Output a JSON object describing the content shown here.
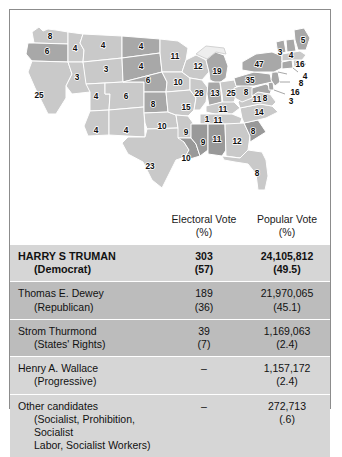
{
  "figure": {
    "kind": "electoral-map-with-results-table"
  },
  "map": {
    "title": "",
    "legend": {
      "winner_shade": "#c9c9c9",
      "runnerup_shade": "#a8a8a8",
      "third_shade": "#999999",
      "border": "#ffffff",
      "outline": "#6b6b6b"
    },
    "states": [
      {
        "code": "WA",
        "name": "Washington",
        "electoral_votes": "8",
        "shade": "light"
      },
      {
        "code": "OR",
        "name": "Oregon",
        "electoral_votes": "6",
        "shade": "dark"
      },
      {
        "code": "CA",
        "name": "California",
        "electoral_votes": "25",
        "shade": "light"
      },
      {
        "code": "ID",
        "name": "Idaho",
        "electoral_votes": "4",
        "shade": "light"
      },
      {
        "code": "NV",
        "name": "Nevada",
        "electoral_votes": "3",
        "shade": "light"
      },
      {
        "code": "MT",
        "name": "Montana",
        "electoral_votes": "4",
        "shade": "light"
      },
      {
        "code": "WY",
        "name": "Wyoming",
        "electoral_votes": "3",
        "shade": "light"
      },
      {
        "code": "UT",
        "name": "Utah",
        "electoral_votes": "4",
        "shade": "light"
      },
      {
        "code": "AZ",
        "name": "Arizona",
        "electoral_votes": "4",
        "shade": "light"
      },
      {
        "code": "CO",
        "name": "Colorado",
        "electoral_votes": "6",
        "shade": "light"
      },
      {
        "code": "NM",
        "name": "New Mexico",
        "electoral_votes": "4",
        "shade": "light"
      },
      {
        "code": "ND",
        "name": "North Dakota",
        "electoral_votes": "4",
        "shade": "dark"
      },
      {
        "code": "SD",
        "name": "South Dakota",
        "electoral_votes": "4",
        "shade": "dark"
      },
      {
        "code": "NE",
        "name": "Nebraska",
        "electoral_votes": "6",
        "shade": "dark"
      },
      {
        "code": "KS",
        "name": "Kansas",
        "electoral_votes": "8",
        "shade": "dark"
      },
      {
        "code": "OK",
        "name": "Oklahoma",
        "electoral_votes": "10",
        "shade": "light"
      },
      {
        "code": "TX",
        "name": "Texas",
        "electoral_votes": "23",
        "shade": "light"
      },
      {
        "code": "MN",
        "name": "Minnesota",
        "electoral_votes": "11",
        "shade": "light"
      },
      {
        "code": "IA",
        "name": "Iowa",
        "electoral_votes": "10",
        "shade": "light"
      },
      {
        "code": "MO",
        "name": "Missouri",
        "electoral_votes": "15",
        "shade": "light"
      },
      {
        "code": "AR",
        "name": "Arkansas",
        "electoral_votes": "9",
        "shade": "light"
      },
      {
        "code": "LA",
        "name": "Louisiana",
        "electoral_votes": "10",
        "shade": "third"
      },
      {
        "code": "WI",
        "name": "Wisconsin",
        "electoral_votes": "12",
        "shade": "light"
      },
      {
        "code": "IL",
        "name": "Illinois",
        "electoral_votes": "28",
        "shade": "light"
      },
      {
        "code": "MI",
        "name": "Michigan",
        "electoral_votes": "19",
        "shade": "dark"
      },
      {
        "code": "IN",
        "name": "Indiana",
        "electoral_votes": "13",
        "shade": "dark"
      },
      {
        "code": "OH",
        "name": "Ohio",
        "electoral_votes": "25",
        "shade": "light"
      },
      {
        "code": "KY",
        "name": "Kentucky",
        "electoral_votes": "11",
        "shade": "light"
      },
      {
        "code": "TN",
        "name": "Tennessee",
        "electoral_votes": "11",
        "shade": "light"
      },
      {
        "code": "MS",
        "name": "Mississippi",
        "electoral_votes": "9",
        "shade": "third"
      },
      {
        "code": "AL",
        "name": "Alabama",
        "electoral_votes": "11",
        "shade": "third"
      },
      {
        "code": "GA",
        "name": "Georgia",
        "electoral_votes": "12",
        "shade": "light"
      },
      {
        "code": "FL",
        "name": "Florida",
        "electoral_votes": "8",
        "shade": "light"
      },
      {
        "code": "SC",
        "name": "South Carolina",
        "electoral_votes": "8",
        "shade": "third"
      },
      {
        "code": "NC",
        "name": "North Carolina",
        "electoral_votes": "14",
        "shade": "light"
      },
      {
        "code": "VA",
        "name": "Virginia",
        "electoral_votes": "11",
        "shade": "light"
      },
      {
        "code": "WV",
        "name": "West Virginia",
        "electoral_votes": "8",
        "shade": "light"
      },
      {
        "code": "MD",
        "name": "Maryland",
        "electoral_votes": "8",
        "shade": "dark"
      },
      {
        "code": "DE",
        "name": "Delaware",
        "electoral_votes": "3",
        "shade": "dark"
      },
      {
        "code": "PA",
        "name": "Pennsylvania",
        "electoral_votes": "35",
        "shade": "dark"
      },
      {
        "code": "NJ",
        "name": "New Jersey",
        "electoral_votes": "16",
        "shade": "dark"
      },
      {
        "code": "NY",
        "name": "New York",
        "electoral_votes": "47",
        "shade": "dark"
      },
      {
        "code": "CT",
        "name": "Connecticut",
        "electoral_votes": "8",
        "shade": "dark"
      },
      {
        "code": "RI",
        "name": "Rhode Island",
        "electoral_votes": "4",
        "shade": "light"
      },
      {
        "code": "MA",
        "name": "Massachusetts",
        "electoral_votes": "16",
        "shade": "light"
      },
      {
        "code": "VT",
        "name": "Vermont",
        "electoral_votes": "3",
        "shade": "dark"
      },
      {
        "code": "NH",
        "name": "New Hampshire",
        "electoral_votes": "4",
        "shade": "dark"
      },
      {
        "code": "ME",
        "name": "Maine",
        "electoral_votes": "5",
        "shade": "dark"
      },
      {
        "code": "DC1",
        "name": "Washington DC area marker",
        "electoral_votes": "1",
        "shade": "light"
      }
    ]
  },
  "table": {
    "headers": {
      "candidate": "",
      "electoral": "Electoral Vote",
      "electoral_pct": "(%)",
      "popular": "Popular Vote",
      "popular_pct": "(%)"
    },
    "rows": [
      {
        "name": "HARRY S TRUMAN",
        "party": "(Democrat)",
        "party2": "",
        "electoral": "303",
        "electoral_pct": "(57)",
        "popular": "24,105,812",
        "popular_pct": "(49.5)",
        "winner": true
      },
      {
        "name": "Thomas E. Dewey",
        "party": "(Republican)",
        "party2": "",
        "electoral": "189",
        "electoral_pct": "(36)",
        "popular": "21,970,065",
        "popular_pct": "(45.1)",
        "winner": false
      },
      {
        "name": "Strom Thurmond",
        "party": "(States' Rights)",
        "party2": "",
        "electoral": "39",
        "electoral_pct": "(7)",
        "popular": "1,169,063",
        "popular_pct": "(2.4)",
        "winner": false
      },
      {
        "name": "Henry A. Wallace",
        "party": "(Progressive)",
        "party2": "",
        "electoral": "–",
        "electoral_pct": "",
        "popular": "1,157,172",
        "popular_pct": "(2.4)",
        "winner": false
      },
      {
        "name": "Other candidates",
        "party": "(Socialist, Prohibition, Socialist",
        "party2": "Labor, Socialist Workers)",
        "electoral": "–",
        "electoral_pct": "",
        "popular": "272,713",
        "popular_pct": "(.6)",
        "winner": false
      }
    ]
  }
}
